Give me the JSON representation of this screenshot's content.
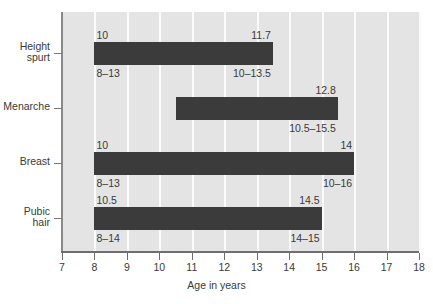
{
  "chart_data": {
    "type": "bar",
    "orientation": "horizontal",
    "title": "",
    "xlabel": "Age in years",
    "ylabel": "",
    "xlim": [
      7,
      18
    ],
    "xticks": [
      7,
      8,
      9,
      10,
      11,
      12,
      13,
      14,
      15,
      16,
      17,
      18
    ],
    "xtick_labels": [
      "7",
      "8",
      "9",
      "10",
      "11",
      "12",
      "13",
      "14",
      "15",
      "16",
      "17",
      "18"
    ],
    "grid": "vertical-white",
    "legend": "none",
    "categories": [
      "Height spurt",
      "Menarche",
      "Breast",
      "Pubic hair"
    ],
    "bars": [
      {
        "category": "Height spurt",
        "label": "Height\nspurt",
        "start": 8,
        "end": 13.5,
        "start_label": "8–13",
        "end_label": "10–13.5",
        "mean_start_label": "10",
        "mean_end_label": "11.7"
      },
      {
        "category": "Menarche",
        "label": "Menarche",
        "start": 10.5,
        "end": 15.5,
        "start_label": "",
        "end_label": "10.5–15.5",
        "mean_start_label": "",
        "mean_end_label": "12.8"
      },
      {
        "category": "Breast",
        "label": "Breast",
        "start": 8,
        "end": 16,
        "start_label": "8–13",
        "end_label": "10–16",
        "mean_start_label": "10",
        "mean_end_label": "14"
      },
      {
        "category": "Pubic hair",
        "label": "Pubic\nhair",
        "start": 8,
        "end": 15,
        "start_label": "8–14",
        "end_label": "14–15",
        "mean_start_label": "10.5",
        "mean_end_label": "14.5"
      }
    ],
    "colors": {
      "bar": "#3b3b3b",
      "plot_background": "#e4e4e4",
      "gridline": "#fbfbfb",
      "axis": "#6e6e6e",
      "text": "#3a3a3a",
      "figure_background": "#ffffff"
    }
  },
  "axis": {
    "x_title": "Age in years"
  },
  "ticks": {
    "x": [
      "7",
      "8",
      "9",
      "10",
      "11",
      "12",
      "13",
      "14",
      "15",
      "16",
      "17",
      "18"
    ],
    "y": [
      "Height\nspurt",
      "Menarche",
      "Breast",
      "Pubic\nhair"
    ]
  },
  "annotations": {
    "height_spurt": {
      "top_left": "10",
      "top_right": "11.7",
      "bottom_left": "8–13",
      "bottom_right": "10–13.5"
    },
    "menarche": {
      "top_left": "",
      "top_right": "12.8",
      "bottom_left": "",
      "bottom_right": "10.5–15.5"
    },
    "breast": {
      "top_left": "10",
      "top_right": "14",
      "bottom_left": "8–13",
      "bottom_right": "10–16"
    },
    "pubic_hair": {
      "top_left": "10.5",
      "top_right": "14.5",
      "bottom_left": "8–14",
      "bottom_right": "14–15"
    }
  }
}
